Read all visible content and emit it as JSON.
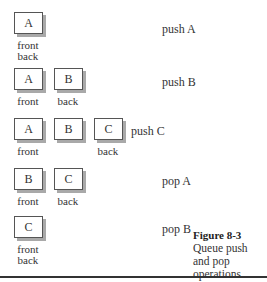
{
  "figure": {
    "number": "Figure 8-3",
    "caption": "Queue push and pop operations"
  },
  "steps": [
    {
      "operation": "push A",
      "items": [
        "A"
      ],
      "front_label": "front",
      "back_label": "back"
    },
    {
      "operation": "push B",
      "items": [
        "A",
        "B"
      ],
      "front_label": "front",
      "back_label": "back"
    },
    {
      "operation": "push C",
      "items": [
        "A",
        "B",
        "C"
      ],
      "front_label": "front",
      "back_label": "back"
    },
    {
      "operation": "pop A",
      "items": [
        "B",
        "C"
      ],
      "front_label": "front",
      "back_label": "back"
    },
    {
      "operation": "pop B",
      "items": [
        "C"
      ],
      "front_label": "front",
      "back_label": "back"
    }
  ]
}
